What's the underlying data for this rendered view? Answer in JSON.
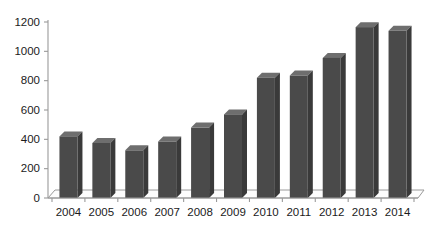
{
  "chart_data": {
    "type": "bar",
    "title": "",
    "subtitle": "",
    "xlabel": "",
    "ylabel": "",
    "categories": [
      "2004",
      "2005",
      "2006",
      "2007",
      "2008",
      "2009",
      "2010",
      "2011",
      "2012",
      "2013",
      "2014"
    ],
    "values": [
      420,
      375,
      325,
      385,
      480,
      570,
      820,
      835,
      955,
      1165,
      1140
    ],
    "series": [
      {
        "name": "",
        "values": [
          420,
          375,
          325,
          385,
          480,
          570,
          820,
          835,
          955,
          1165,
          1140
        ]
      }
    ],
    "ylim": [
      0,
      1200
    ],
    "y_ticks": [
      0,
      200,
      400,
      600,
      800,
      1000,
      1200
    ],
    "y_tick_labels": [
      "0",
      "200",
      "400",
      "600",
      "800",
      "1000",
      "1200"
    ],
    "x_tick_labels": [
      "2004",
      "2005",
      "2006",
      "2007",
      "2008",
      "2009",
      "2010",
      "2011",
      "2012",
      "2013",
      "2014"
    ],
    "grid": false,
    "legend": null,
    "legend_position": "none",
    "annotations": [],
    "style": "3d-bar",
    "colors": {
      "bar_front": "#4a4a4a",
      "bar_top": "#6e6e6e",
      "bar_side": "#3a3a3a",
      "axis": "#9a9a9a",
      "text": "#1b1b1b",
      "background": "#ffffff"
    }
  }
}
